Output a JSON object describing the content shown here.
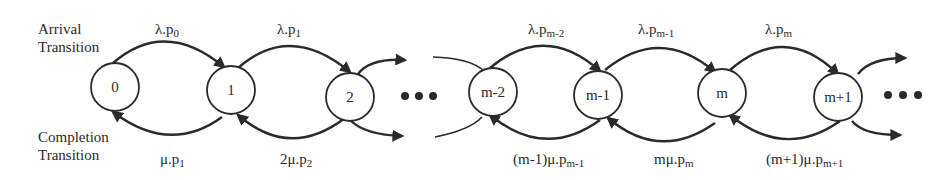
{
  "diagram": {
    "type": "birth-death Markov chain (state transition diagram)",
    "side_labels": {
      "arrival": [
        "Arrival",
        "Transition"
      ],
      "completion": [
        "Completion",
        "Transition"
      ]
    },
    "nodes": [
      {
        "id": "0",
        "label": "0"
      },
      {
        "id": "1",
        "label": "1"
      },
      {
        "id": "2",
        "label": "2"
      },
      {
        "id": "m-2",
        "label": "m-2"
      },
      {
        "id": "m-1",
        "label": "m-1"
      },
      {
        "id": "m",
        "label": "m"
      },
      {
        "id": "m+1",
        "label": "m+1"
      }
    ],
    "ellipsis": "•••",
    "arrival_edges": [
      {
        "from": "0",
        "to": "1",
        "base": "λ.p",
        "sub": "0"
      },
      {
        "from": "1",
        "to": "2",
        "base": "λ.p",
        "sub": "1"
      },
      {
        "from": "m-2",
        "to": "m-1",
        "base": "λ.p",
        "sub": "m-2"
      },
      {
        "from": "m-1",
        "to": "m",
        "base": "λ.p",
        "sub": "m-1"
      },
      {
        "from": "m",
        "to": "m+1",
        "base": "λ.p",
        "sub": "m"
      }
    ],
    "completion_edges": [
      {
        "from": "1",
        "to": "0",
        "base": "μ.p",
        "sub": "1"
      },
      {
        "from": "2",
        "to": "1",
        "base": "2μ.p",
        "sub": "2"
      },
      {
        "from": "m-1",
        "to": "m-2",
        "base": "(m-1)μ.p",
        "sub": "m-1"
      },
      {
        "from": "m",
        "to": "m-1",
        "base": "mμ.p",
        "sub": "m"
      },
      {
        "from": "m+1",
        "to": "m",
        "base": "(m+1)μ.p",
        "sub": "m+1"
      }
    ]
  }
}
